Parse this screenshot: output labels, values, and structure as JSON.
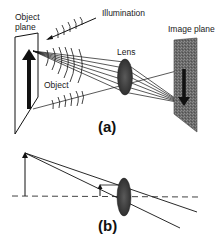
{
  "panel_a": {
    "caption": "(a)",
    "labels": {
      "object_plane_line1": "Object",
      "object_plane_line2": "plane",
      "illumination": "Illumination",
      "lens": "Lens",
      "image_plane": "Image plane",
      "object": "Object"
    }
  },
  "panel_b": {
    "caption": "(b)"
  },
  "colors": {
    "ink": "#111111",
    "lens_fill": "#4a4a4a",
    "image_plane_fill": "#6e6e6e",
    "background": "#ffffff"
  }
}
